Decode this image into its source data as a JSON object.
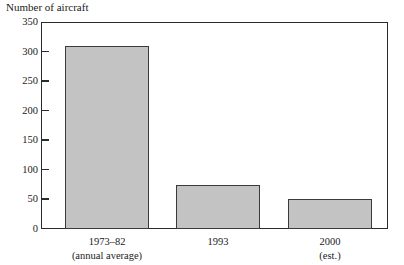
{
  "chart_data": {
    "type": "bar",
    "title": "",
    "xlabel": "",
    "ylabel": "Number of aircraft",
    "categories": [
      "1973–82\n(annual average)",
      "1993",
      "2000\n(est.)"
    ],
    "values": [
      310,
      75,
      50
    ],
    "ylim": [
      0,
      350
    ],
    "yticks": [
      0,
      50,
      100,
      150,
      200,
      250,
      300,
      350
    ],
    "ytick_labels": [
      "0",
      "50",
      "100",
      "150",
      "200",
      "250",
      "300",
      "350"
    ],
    "grid": false,
    "legend": null,
    "bar_color": "#c3c3c3",
    "bar_edge_color": "#3a3a3a",
    "frame_color": "#2b2b2b",
    "background": "#ffffff"
  },
  "axis": {
    "y_title": "Number of aircraft",
    "ticks": [
      {
        "label": "350",
        "value": 350
      },
      {
        "label": "300",
        "value": 300
      },
      {
        "label": "250",
        "value": 250
      },
      {
        "label": "200",
        "value": 200
      },
      {
        "label": "150",
        "value": 150
      },
      {
        "label": "100",
        "value": 100
      },
      {
        "label": "50",
        "value": 50
      },
      {
        "label": "0",
        "value": 0
      }
    ]
  },
  "bars": [
    {
      "value": 310,
      "label_line1": "1973–82",
      "label_line2": "(annual average)"
    },
    {
      "value": 75,
      "label_line1": "1993",
      "label_line2": ""
    },
    {
      "value": 50,
      "label_line1": "2000",
      "label_line2": "(est.)"
    }
  ]
}
